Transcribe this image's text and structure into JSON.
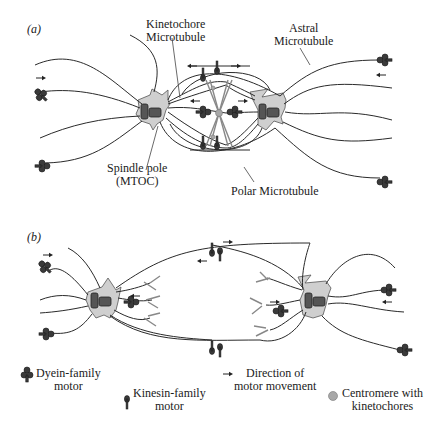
{
  "panels": {
    "a": {
      "label": "(a)",
      "labels": {
        "kinetochore_mt_line1": "Kinetochore",
        "kinetochore_mt_line2": "Microtubule",
        "astral_mt_line1": "Astral",
        "astral_mt_line2": "Microtubule",
        "spindle_pole_line1": "Spindle pole",
        "spindle_pole_line2": "(MTOC)",
        "polar_mt": "Polar Microtubule"
      }
    },
    "b": {
      "label": "(b)"
    }
  },
  "legend": {
    "dynein_line1": "Dyein-family",
    "dynein_line2": "motor",
    "kinesin_line1": "Kinesin-family",
    "kinesin_line2": "motor",
    "direction_line1": "Direction of",
    "direction_line2": "motor movement",
    "centromere_line1": "Centromere with",
    "centromere_line2": "kinetochores"
  },
  "icons": {
    "dynein": "dynein-motor-icon",
    "kinesin": "kinesin-motor-icon",
    "arrow": "direction-arrow-icon",
    "centromere": "centromere-icon"
  },
  "colors": {
    "pole_fill": "#cfcfcf",
    "centriole": "#555555",
    "motor": "#3a3a3a",
    "centromere": "#a8a8a8"
  }
}
